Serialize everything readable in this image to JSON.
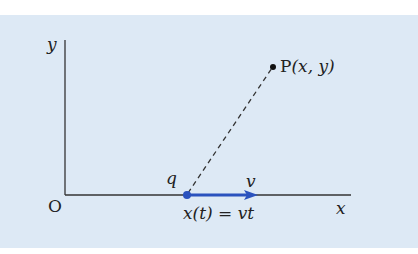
{
  "figure": {
    "axes": {
      "y_label": "y",
      "x_label": "x",
      "origin_label": "O"
    },
    "point": {
      "label_prefix": "P",
      "label_coords": "(x, y)"
    },
    "charge": {
      "label": "q"
    },
    "velocity": {
      "label": "v",
      "color": "#2a52be"
    },
    "equation": "x(t) = vt",
    "colors": {
      "background": "#dde9f5",
      "axis": "#333333",
      "dashed_line": "#333333",
      "charge_arrow": "#2a52be"
    }
  }
}
